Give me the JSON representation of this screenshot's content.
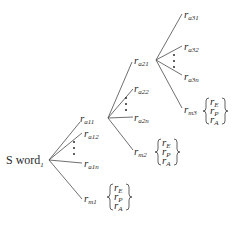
{
  "diagram": {
    "type": "tree",
    "root": {
      "label": "S word",
      "subscript": "1"
    },
    "levels": [
      {
        "parent": "S word1",
        "children": [
          {
            "label": "r",
            "subscript": "a11"
          },
          {
            "label": "r",
            "subscript": "a12"
          },
          {
            "label": "r",
            "subscript": "a1n"
          },
          {
            "label": "r",
            "subscript": "m1",
            "brace_items": [
              {
                "label": "r",
                "subscript": "E"
              },
              {
                "label": "r",
                "subscript": "P"
              },
              {
                "label": "r",
                "subscript": "A"
              }
            ]
          }
        ],
        "ellipsis": "⋮"
      },
      {
        "parent": "ra11",
        "children": [
          {
            "label": "r",
            "subscript": "a21"
          },
          {
            "label": "r",
            "subscript": "a22"
          },
          {
            "label": "r",
            "subscript": "a2n"
          },
          {
            "label": "r",
            "subscript": "m2",
            "brace_items": [
              {
                "label": "r",
                "subscript": "E"
              },
              {
                "label": "r",
                "subscript": "P"
              },
              {
                "label": "r",
                "subscript": "A"
              }
            ]
          }
        ],
        "ellipsis": "⋮"
      },
      {
        "parent": "ra21",
        "children": [
          {
            "label": "r",
            "subscript": "a31"
          },
          {
            "label": "r",
            "subscript": "a32"
          },
          {
            "label": "r",
            "subscript": "a3n"
          },
          {
            "label": "r",
            "subscript": "m3",
            "brace_items": [
              {
                "label": "r",
                "subscript": "E"
              },
              {
                "label": "r",
                "subscript": "P"
              },
              {
                "label": "r",
                "subscript": "A"
              }
            ]
          }
        ],
        "ellipsis": "⋮"
      }
    ]
  },
  "labels": {
    "root_main": "S word",
    "root_sub": "1",
    "r": "r",
    "a11": "a11",
    "a12": "a12",
    "a1n": "a1n",
    "m1": "m1",
    "a21": "a21",
    "a22": "a22",
    "a2n": "a2n",
    "m2": "m2",
    "a31": "a31",
    "a32": "a32",
    "a3n": "a3n",
    "m3": "m3",
    "E": "E",
    "P": "P",
    "A": "A"
  }
}
